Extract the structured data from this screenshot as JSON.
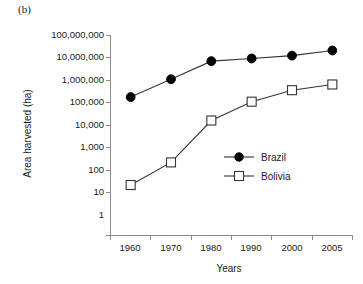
{
  "panel": {
    "label": "(b)"
  },
  "chart_data": {
    "type": "line",
    "title": "",
    "xlabel": "Years",
    "ylabel": "Area harvested (ha)",
    "categories": [
      "1960",
      "1970",
      "1980",
      "1990",
      "2000",
      "2005"
    ],
    "yscale": "log",
    "ylim": [
      1,
      100000000
    ],
    "ytick_labels": [
      "100,000,000",
      "10,000,000",
      "1,000,000",
      "100,000",
      "10,000",
      "1,000",
      "100",
      "10",
      "1"
    ],
    "ytick_values": [
      100000000,
      10000000,
      1000000,
      100000,
      10000,
      1000,
      100,
      10,
      1
    ],
    "grid": false,
    "legend_position": "center-right",
    "series": [
      {
        "name": "Brazil",
        "marker": "filled-circle",
        "color": "#000000",
        "values": [
          330000,
          1700000,
          9000000,
          11500000,
          15000000,
          24000000
        ]
      },
      {
        "name": "Bolivia",
        "marker": "open-square",
        "color": "#333333",
        "values": [
          100,
          800,
          38000,
          215000,
          620000,
          1050000
        ]
      }
    ]
  },
  "legend": {
    "entries": [
      {
        "label": "Brazil"
      },
      {
        "label": "Bolivia"
      }
    ]
  }
}
